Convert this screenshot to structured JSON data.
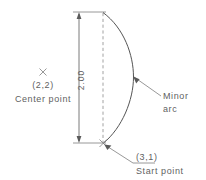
{
  "diagram": {
    "type": "cad-technical-drawing",
    "dimension": {
      "value": "2.00",
      "orientation": "vertical",
      "rotated_deg": -90
    },
    "center_point": {
      "marker": "x-marker",
      "coordinate_label": "(2,2)",
      "name_label": "Center  point"
    },
    "start_point": {
      "marker": "x-marker",
      "coordinate_label": "(3,1)",
      "name_label": "Start  point"
    },
    "arc": {
      "label_line1": "Minor",
      "label_line2": "arc"
    },
    "colors": {
      "line": "#6b6b6b",
      "arc": "#555555",
      "dashed": "#8c8c8c",
      "text": "#5f5f5f",
      "background": "#ffffff"
    }
  }
}
